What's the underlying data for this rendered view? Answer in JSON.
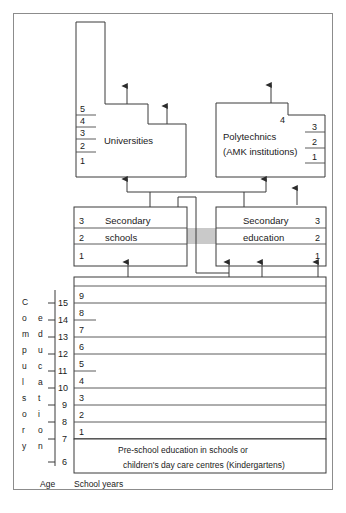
{
  "diagram": {
    "title_implicit": "Education system structure",
    "tertiary": {
      "universities": {
        "label": "Universities",
        "years": [
          "5",
          "4",
          "3",
          "2",
          "1"
        ]
      },
      "polytechnics": {
        "label_line1": "Polytechnics",
        "label_line2": "(AMK institutions)",
        "notch_year": "4",
        "years": [
          "3",
          "2",
          "1"
        ]
      }
    },
    "upper_secondary": {
      "left": {
        "label_line1": "Secondary",
        "label_line2": "schools",
        "years": [
          "3",
          "2",
          "1"
        ],
        "shaded_year": "2"
      },
      "right": {
        "label_line1": "Secondary",
        "label_line2": "education",
        "years": [
          "3",
          "2",
          "1"
        ],
        "shaded_year": "2"
      }
    },
    "comprehensive": {
      "side_label_1": "Compulsory",
      "side_label_2": "education",
      "school_years": [
        "9",
        "8",
        "7",
        "6",
        "5",
        "4",
        "3",
        "2",
        "1"
      ],
      "shaded_years": [
        "9",
        "6",
        "3",
        "1"
      ],
      "ages": [
        "15",
        "14",
        "13",
        "12",
        "11",
        "10",
        "9",
        "8",
        "7",
        "6"
      ]
    },
    "preschool": {
      "line1": "Pre-school education in schools or",
      "line2": "children's day care centres (Kindergartens)"
    },
    "axis_labels": {
      "age": "Age",
      "school_years": "School years"
    },
    "colors": {
      "band": "#c9c9c9",
      "line": "#3a3a3a",
      "frame": "#8c8c8c",
      "background": "#ffffff"
    }
  }
}
